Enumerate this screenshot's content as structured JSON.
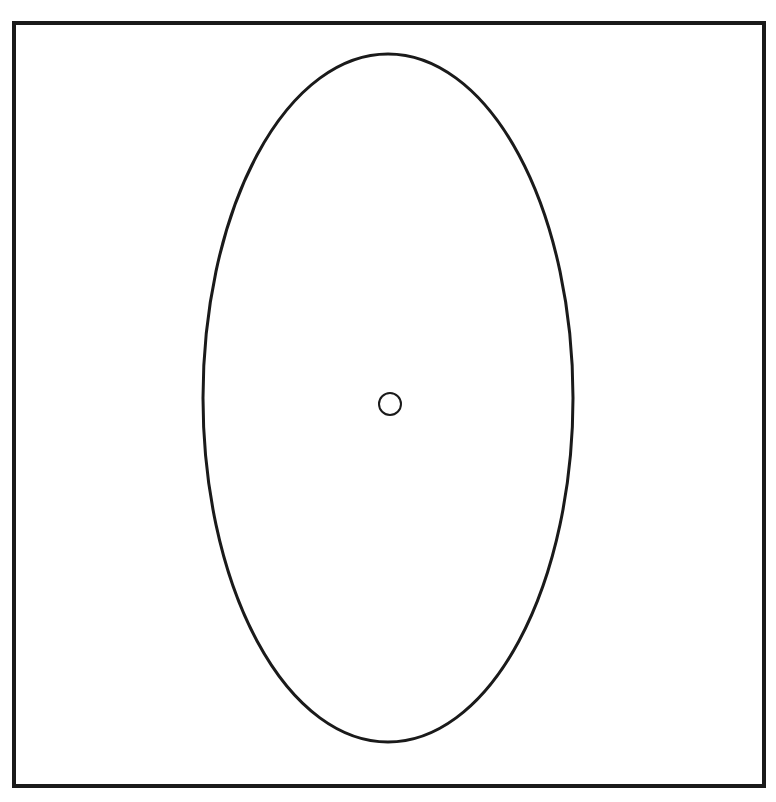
{
  "diagram": {
    "background": "#ffffff",
    "stroke_color": "#1a1a1a",
    "frame": {
      "x": 14,
      "y": 23,
      "width": 750,
      "height": 763,
      "stroke_width": 4
    },
    "ellipse": {
      "cx": 388,
      "cy": 398,
      "rx": 185,
      "ry": 344,
      "stroke_width": 3
    },
    "center_circle": {
      "cx": 390,
      "cy": 404,
      "r": 11,
      "stroke_width": 2
    }
  }
}
